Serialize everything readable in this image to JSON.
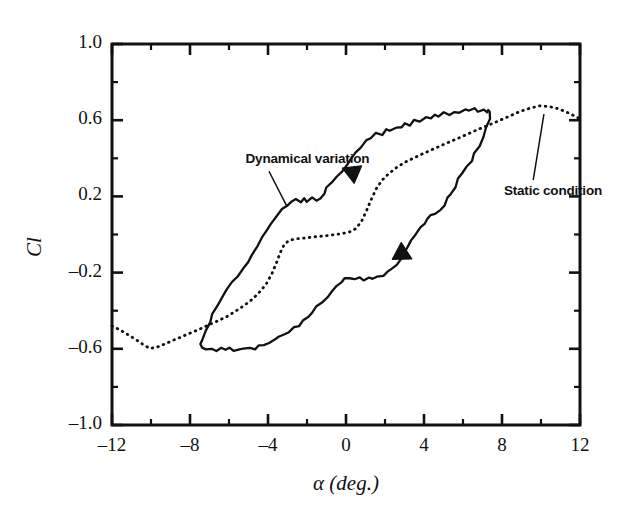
{
  "figure": {
    "background": "#ffffff",
    "ink_color": "#111111",
    "frame": {
      "x0": 112,
      "y0": 44,
      "x1": 580,
      "y1": 425
    }
  },
  "chart_data": {
    "type": "line",
    "title": "",
    "xlabel": "α (deg.)",
    "ylabel": "Cl",
    "xlim": [
      -12,
      12
    ],
    "ylim": [
      -1.0,
      1.0
    ],
    "grid": false,
    "legend_position": "in-plot annotations",
    "x_major_ticks": [
      -12,
      -8,
      -4,
      0,
      4,
      8,
      12
    ],
    "x_tick_labels": [
      "-12",
      "-8",
      "-4",
      "0",
      "4",
      "8",
      "12"
    ],
    "x_minor_ticks": [
      -10,
      -6,
      -2,
      2,
      6,
      10
    ],
    "y_major_ticks": [
      -1.0,
      -0.6,
      -0.2,
      0.2,
      0.6,
      1.0
    ],
    "y_tick_labels": [
      "-1.0",
      "-0.6",
      "-0.2",
      "0.2",
      "0.6",
      "1.0"
    ],
    "y_minor_ticks": [
      -0.8,
      -0.4,
      0.0,
      0.4,
      0.8
    ],
    "series": [
      {
        "name": "Static condition",
        "style": "dotted",
        "color": "#111111",
        "points": [
          [
            -12.0,
            -0.48
          ],
          [
            -11.6,
            -0.5
          ],
          [
            -11.2,
            -0.525
          ],
          [
            -10.8,
            -0.55
          ],
          [
            -10.4,
            -0.578
          ],
          [
            -10.05,
            -0.598
          ],
          [
            -9.7,
            -0.592
          ],
          [
            -9.3,
            -0.575
          ],
          [
            -8.9,
            -0.557
          ],
          [
            -8.5,
            -0.54
          ],
          [
            -8.1,
            -0.522
          ],
          [
            -7.7,
            -0.505
          ],
          [
            -7.3,
            -0.487
          ],
          [
            -6.9,
            -0.468
          ],
          [
            -6.5,
            -0.45
          ],
          [
            -6.1,
            -0.43
          ],
          [
            -5.7,
            -0.405
          ],
          [
            -5.3,
            -0.378
          ],
          [
            -4.9,
            -0.348
          ],
          [
            -4.5,
            -0.31
          ],
          [
            -4.1,
            -0.262
          ],
          [
            -3.8,
            -0.205
          ],
          [
            -3.55,
            -0.145
          ],
          [
            -3.35,
            -0.09
          ],
          [
            -3.15,
            -0.05
          ],
          [
            -2.9,
            -0.03
          ],
          [
            -2.5,
            -0.022
          ],
          [
            -2.05,
            -0.018
          ],
          [
            -1.6,
            -0.012
          ],
          [
            -1.15,
            -0.008
          ],
          [
            -0.7,
            -0.002
          ],
          [
            -0.25,
            0.004
          ],
          [
            0.15,
            0.012
          ],
          [
            0.5,
            0.03
          ],
          [
            0.8,
            0.07
          ],
          [
            1.05,
            0.125
          ],
          [
            1.3,
            0.185
          ],
          [
            1.55,
            0.24
          ],
          [
            1.85,
            0.285
          ],
          [
            2.2,
            0.32
          ],
          [
            2.6,
            0.352
          ],
          [
            3.0,
            0.378
          ],
          [
            3.45,
            0.4
          ],
          [
            3.9,
            0.422
          ],
          [
            4.4,
            0.445
          ],
          [
            4.9,
            0.468
          ],
          [
            5.4,
            0.49
          ],
          [
            5.9,
            0.512
          ],
          [
            6.4,
            0.535
          ],
          [
            6.9,
            0.557
          ],
          [
            7.4,
            0.578
          ],
          [
            7.9,
            0.6
          ],
          [
            8.4,
            0.622
          ],
          [
            8.9,
            0.645
          ],
          [
            9.4,
            0.662
          ],
          [
            9.9,
            0.675
          ],
          [
            10.4,
            0.672
          ],
          [
            10.9,
            0.66
          ],
          [
            11.4,
            0.638
          ],
          [
            12.0,
            0.608
          ]
        ]
      },
      {
        "name": "Dynamical variation",
        "style": "solid",
        "color": "#111111",
        "loop": true,
        "upper_branch_direction": "leftward-downstroke",
        "lower_branch_direction": "rightward-upstroke",
        "points": [
          [
            7.3,
            0.648
          ],
          [
            7.05,
            0.662
          ],
          [
            6.8,
            0.648
          ],
          [
            6.55,
            0.66
          ],
          [
            6.3,
            0.645
          ],
          [
            6.05,
            0.655
          ],
          [
            5.8,
            0.638
          ],
          [
            5.55,
            0.648
          ],
          [
            5.3,
            0.628
          ],
          [
            5.05,
            0.638
          ],
          [
            4.8,
            0.618
          ],
          [
            4.55,
            0.628
          ],
          [
            4.3,
            0.605
          ],
          [
            4.05,
            0.612
          ],
          [
            3.8,
            0.592
          ],
          [
            3.55,
            0.6
          ],
          [
            3.3,
            0.578
          ],
          [
            3.05,
            0.585
          ],
          [
            2.8,
            0.562
          ],
          [
            2.55,
            0.568
          ],
          [
            2.3,
            0.545
          ],
          [
            2.05,
            0.552
          ],
          [
            1.8,
            0.528
          ],
          [
            1.55,
            0.532
          ],
          [
            1.3,
            0.505
          ],
          [
            1.05,
            0.495
          ],
          [
            0.8,
            0.462
          ],
          [
            0.55,
            0.432
          ],
          [
            0.3,
            0.4
          ],
          [
            0.05,
            0.368
          ],
          [
            -0.2,
            0.33
          ],
          [
            -0.45,
            0.298
          ],
          [
            -0.7,
            0.268
          ],
          [
            -0.95,
            0.24
          ],
          [
            -1.15,
            0.212
          ],
          [
            -1.35,
            0.192
          ],
          [
            -1.55,
            0.18
          ],
          [
            -1.75,
            0.188
          ],
          [
            -1.95,
            0.175
          ],
          [
            -2.15,
            0.185
          ],
          [
            -2.35,
            0.172
          ],
          [
            -2.55,
            0.18
          ],
          [
            -2.8,
            0.168
          ],
          [
            -3.05,
            0.155
          ],
          [
            -3.3,
            0.128
          ],
          [
            -3.55,
            0.098
          ],
          [
            -3.8,
            0.062
          ],
          [
            -4.05,
            0.022
          ],
          [
            -4.3,
            -0.02
          ],
          [
            -4.55,
            -0.062
          ],
          [
            -4.8,
            -0.102
          ],
          [
            -5.05,
            -0.142
          ],
          [
            -5.3,
            -0.18
          ],
          [
            -5.55,
            -0.218
          ],
          [
            -5.8,
            -0.255
          ],
          [
            -6.05,
            -0.292
          ],
          [
            -6.3,
            -0.33
          ],
          [
            -6.55,
            -0.372
          ],
          [
            -6.8,
            -0.415
          ],
          [
            -7.0,
            -0.462
          ],
          [
            -7.2,
            -0.508
          ],
          [
            -7.35,
            -0.548
          ],
          [
            -7.45,
            -0.578
          ],
          [
            -7.4,
            -0.598
          ],
          [
            -7.2,
            -0.608
          ],
          [
            -6.95,
            -0.6
          ],
          [
            -6.7,
            -0.61
          ],
          [
            -6.45,
            -0.6
          ],
          [
            -6.2,
            -0.612
          ],
          [
            -5.95,
            -0.6
          ],
          [
            -5.7,
            -0.608
          ],
          [
            -5.45,
            -0.598
          ],
          [
            -5.2,
            -0.605
          ],
          [
            -4.95,
            -0.592
          ],
          [
            -4.7,
            -0.598
          ],
          [
            -4.45,
            -0.585
          ],
          [
            -4.2,
            -0.578
          ],
          [
            -3.95,
            -0.565
          ],
          [
            -3.7,
            -0.552
          ],
          [
            -3.45,
            -0.538
          ],
          [
            -3.2,
            -0.522
          ],
          [
            -2.95,
            -0.508
          ],
          [
            -2.7,
            -0.492
          ],
          [
            -2.45,
            -0.475
          ],
          [
            -2.2,
            -0.455
          ],
          [
            -1.95,
            -0.432
          ],
          [
            -1.7,
            -0.408
          ],
          [
            -1.45,
            -0.382
          ],
          [
            -1.2,
            -0.355
          ],
          [
            -0.95,
            -0.328
          ],
          [
            -0.7,
            -0.3
          ],
          [
            -0.45,
            -0.275
          ],
          [
            -0.25,
            -0.252
          ],
          [
            -0.05,
            -0.235
          ],
          [
            0.15,
            -0.228
          ],
          [
            0.4,
            -0.238
          ],
          [
            0.65,
            -0.228
          ],
          [
            0.9,
            -0.238
          ],
          [
            1.15,
            -0.228
          ],
          [
            1.4,
            -0.235
          ],
          [
            1.65,
            -0.222
          ],
          [
            1.9,
            -0.215
          ],
          [
            2.15,
            -0.2
          ],
          [
            2.4,
            -0.18
          ],
          [
            2.6,
            -0.155
          ],
          [
            2.8,
            -0.128
          ],
          [
            3.0,
            -0.098
          ],
          [
            3.2,
            -0.065
          ],
          [
            3.4,
            -0.032
          ],
          [
            3.6,
            0.002
          ],
          [
            3.8,
            0.035
          ],
          [
            4.0,
            0.062
          ],
          [
            4.2,
            0.082
          ],
          [
            4.4,
            0.095
          ],
          [
            4.6,
            0.112
          ],
          [
            4.8,
            0.132
          ],
          [
            5.0,
            0.158
          ],
          [
            5.2,
            0.188
          ],
          [
            5.4,
            0.218
          ],
          [
            5.6,
            0.252
          ],
          [
            5.8,
            0.288
          ],
          [
            6.0,
            0.322
          ],
          [
            6.2,
            0.358
          ],
          [
            6.4,
            0.392
          ],
          [
            6.6,
            0.428
          ],
          [
            6.8,
            0.468
          ],
          [
            7.0,
            0.512
          ],
          [
            7.2,
            0.562
          ],
          [
            7.35,
            0.608
          ],
          [
            7.38,
            0.64
          ],
          [
            7.3,
            0.648
          ]
        ]
      }
    ],
    "annotations": [
      {
        "text": "Dynamical variation",
        "text_x": -5.15,
        "text_y": 0.39,
        "leader_from_x": -3.95,
        "leader_from_y": 0.332,
        "leader_to_x": -3.05,
        "leader_to_y": 0.152
      },
      {
        "text": "Static condition",
        "text_x": 8.1,
        "text_y": 0.225,
        "leader_from_x": 9.6,
        "leader_from_y": 0.285,
        "leader_to_x": 10.15,
        "leader_to_y": 0.632
      }
    ],
    "arrow_markers": [
      {
        "x": 0.25,
        "y": 0.33,
        "direction": "left-up",
        "on_series": "Dynamical variation"
      },
      {
        "x": 2.95,
        "y": -0.105,
        "direction": "right-down",
        "on_series": "Dynamical variation"
      }
    ]
  }
}
